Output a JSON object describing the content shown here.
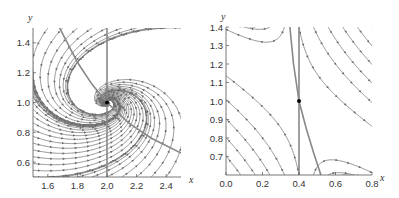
{
  "chart_data": [
    {
      "type": "streamplot",
      "title": "",
      "xlabel": "x",
      "ylabel": "y",
      "xlim": [
        1.5,
        2.5
      ],
      "ylim": [
        0.5,
        1.5
      ],
      "xticks": [
        "1.6",
        "1.8",
        "2.0",
        "2.2",
        "2.4"
      ],
      "yticks": [
        "0.6",
        "0.8",
        "1.0",
        "1.2",
        "1.4"
      ],
      "fixed_point": [
        2.0,
        1.0
      ],
      "nullcline_vertical_x": 2.0,
      "nullcline_curve_points": [
        [
          1.68,
          1.5
        ],
        [
          1.8,
          1.27
        ],
        [
          1.9,
          1.12
        ],
        [
          2.0,
          1.0
        ],
        [
          2.15,
          0.86
        ],
        [
          2.3,
          0.76
        ],
        [
          2.5,
          0.66
        ]
      ],
      "field": {
        "a": -1.2,
        "b": -3.0,
        "c": 1.6,
        "d": -1.4
      },
      "grid": false
    },
    {
      "type": "streamplot",
      "title": "",
      "xlabel": "x",
      "ylabel": "y",
      "xlim": [
        0.0,
        0.8
      ],
      "ylim": [
        0.6,
        1.4
      ],
      "xticks": [
        "0.0",
        "0.2",
        "0.4",
        "0.6",
        "0.8"
      ],
      "yticks": [
        "0.7",
        "0.8",
        "0.9",
        "1.0",
        "1.1",
        "1.2",
        "1.3",
        "1.4"
      ],
      "fixed_point": [
        0.4,
        1.0
      ],
      "nullcline_vertical_x": 0.4,
      "nullcline_curve_points": [
        [
          0.35,
          1.4
        ],
        [
          0.37,
          1.2
        ],
        [
          0.4,
          1.0
        ],
        [
          0.44,
          0.85
        ],
        [
          0.48,
          0.72
        ],
        [
          0.52,
          0.6
        ]
      ],
      "field": {
        "a": 1.0,
        "b": 0.1,
        "c": -0.9,
        "d": -0.5
      },
      "grid": false
    }
  ]
}
